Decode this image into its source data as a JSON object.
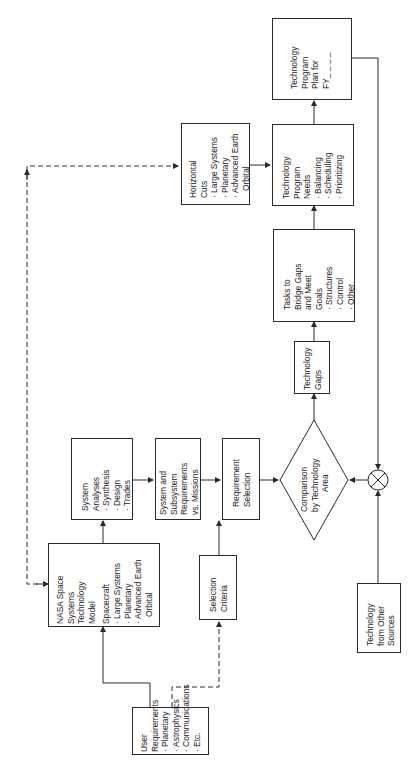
{
  "diagram": {
    "orientation": "rotated 90 degrees counter-clockwise",
    "nodes": {
      "user_requirements": {
        "title": [
          "User",
          "Requirements"
        ],
        "bullets": [
          "Planetary",
          "Astrophysics",
          "Communications",
          "Etc."
        ]
      },
      "nasa_model": {
        "title": [
          "NASA Space",
          "Systems",
          "Technology",
          "Model"
        ],
        "subtitle": "Spacecraft",
        "bullets": [
          "Large Systems",
          "Planetary",
          "Advanced Earth"
        ],
        "tail": "Orbital"
      },
      "selection_criteria": {
        "title": [
          "Selection",
          "Criteria"
        ]
      },
      "system_analyses": {
        "title": [
          "System",
          "Analyses"
        ],
        "bullets": [
          "Synthesis",
          "Design",
          "Trades"
        ]
      },
      "system_subsystem": {
        "title": [
          "System and",
          "Subsystem",
          "Requirements",
          "vs. Missions"
        ]
      },
      "requirement_selection": {
        "title": [
          "Requirement",
          "Selection"
        ]
      },
      "comparison": {
        "title": [
          "Comparison",
          "by Technology",
          "Area"
        ]
      },
      "technology_other": {
        "title": [
          "Technology",
          "from Other",
          "Sources"
        ]
      },
      "technology_gaps": {
        "title": [
          "Technology",
          "Gaps"
        ]
      },
      "tasks": {
        "title": [
          "Tasks to",
          "Bridge Gaps",
          "and Meet",
          "Goals"
        ],
        "bullets": [
          "Structures",
          "Control",
          "Other"
        ]
      },
      "horizontal_cuts": {
        "title": [
          "Horizontal",
          "Cuts"
        ],
        "bullets": [
          "Large Systems",
          "Planetary",
          "Advanced Earth"
        ],
        "tail": "Orbital"
      },
      "program_needs": {
        "title": [
          "Technology",
          "Program",
          "Needs"
        ],
        "bullets": [
          "Balancing",
          "Scheduling",
          "Prioritizing"
        ]
      },
      "program_plan": {
        "title": [
          "Technology",
          "Program",
          "Plan for",
          "FY_ _ _ _"
        ]
      }
    },
    "junction_symbol": "⊗",
    "colors": {
      "line": "#2a2a2a",
      "background": "#ffffff"
    }
  }
}
